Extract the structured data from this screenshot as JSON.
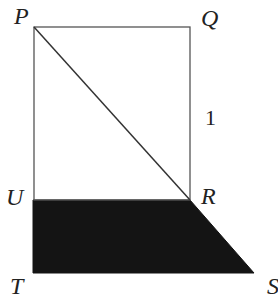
{
  "diagram": {
    "labels": {
      "P": "P",
      "Q": "Q",
      "R": "R",
      "S": "S",
      "T": "T",
      "U": "U",
      "side_length": "1"
    },
    "vertices": {
      "P": [
        34,
        27
      ],
      "Q": [
        190,
        27
      ],
      "R": [
        190,
        200
      ],
      "U": [
        34,
        200
      ],
      "T": [
        33,
        273
      ],
      "S": [
        254,
        273
      ]
    },
    "colors": {
      "line": "#555555",
      "fill": "#141414"
    }
  }
}
